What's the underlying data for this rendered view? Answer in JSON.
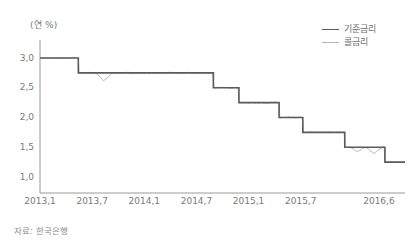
{
  "chart_data": {
    "type": "line",
    "title": "",
    "subtitle": "",
    "xlabel": "",
    "ylabel": "(연 %)",
    "unit_label": "(연 %)",
    "source_note": "자료: 한국은행",
    "grid": false,
    "legend_position": "top-right",
    "ylim": [
      1.0,
      3.0
    ],
    "yticks": [
      3.0,
      2.5,
      2.0,
      1.5,
      1.0
    ],
    "ytick_labels": [
      "3,0",
      "2,5",
      "2,0",
      "1,5",
      "1,0"
    ],
    "xtick_labels": [
      "2013,1",
      "2013,7",
      "2014,1",
      "2014,7",
      "2015,1",
      "2015,7",
      "2016,6"
    ],
    "xtick_positions": [
      0.0,
      0.1429,
      0.2857,
      0.4286,
      0.5714,
      0.7143,
      0.9286
    ],
    "series": [
      {
        "name": "기준금리",
        "color": "#5b5b5b",
        "width": 1.6,
        "style": "step",
        "steps": [
          {
            "from": 0.0,
            "to": 0.105,
            "value": 3.0
          },
          {
            "from": 0.105,
            "to": 0.475,
            "value": 2.75
          },
          {
            "from": 0.475,
            "to": 0.545,
            "value": 2.5
          },
          {
            "from": 0.545,
            "to": 0.655,
            "value": 2.25
          },
          {
            "from": 0.655,
            "to": 0.72,
            "value": 2.0
          },
          {
            "from": 0.72,
            "to": 0.835,
            "value": 1.75
          },
          {
            "from": 0.835,
            "to": 0.945,
            "value": 1.5
          },
          {
            "from": 0.945,
            "to": 1.0,
            "value": 1.25
          }
        ]
      },
      {
        "name": "콜금리",
        "color": "#b0b0b0",
        "width": 0.9,
        "style": "noisy-step",
        "notes": "tracks base rate closely with small downward spikes",
        "dips": [
          {
            "x": 0.175,
            "depth": 0.14
          },
          {
            "x": 0.87,
            "depth": 0.07
          },
          {
            "x": 0.915,
            "depth": 0.11
          }
        ]
      }
    ],
    "axis": {
      "plot_left": 40,
      "plot_right": 405,
      "plot_top": 40,
      "plot_bottom": 193,
      "spine_color": "#9a9a9a"
    }
  }
}
